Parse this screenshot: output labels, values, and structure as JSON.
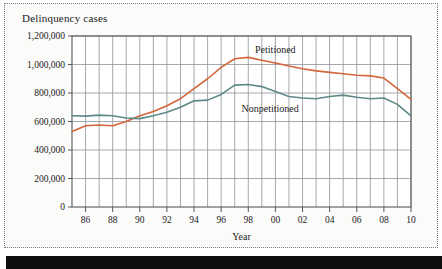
{
  "figure": {
    "title": "Delinquency cases",
    "colors": {
      "petitioned": "#d4663c",
      "nonpetitioned": "#5c8a86",
      "grid": "#8f9398",
      "axis": "#55585c",
      "text": "#1a1a1a",
      "background": "#fbfbfa",
      "frame": "#7a7a7a",
      "bottom_band": "#110f0d"
    }
  },
  "chart_data": {
    "type": "line",
    "title": "Delinquency cases",
    "xlabel": "Year",
    "ylabel": "Delinquency cases",
    "xlim": [
      1985,
      2010
    ],
    "ylim": [
      0,
      1200000
    ],
    "grid": true,
    "legend_position": "inline-annotation",
    "y_ticks": [
      0,
      200000,
      400000,
      600000,
      800000,
      1000000,
      1200000
    ],
    "y_tick_labels": [
      "0",
      "200,000",
      "400,000",
      "600,000",
      "800,000",
      "1,000,000",
      "1,200,000"
    ],
    "x_ticks": [
      1986,
      1988,
      1990,
      1992,
      1994,
      1996,
      1998,
      2000,
      2002,
      2004,
      2006,
      2008,
      2010
    ],
    "x_tick_labels": [
      "86",
      "88",
      "90",
      "92",
      "94",
      "96",
      "98",
      "00",
      "02",
      "04",
      "06",
      "08",
      "10"
    ],
    "x": [
      1985,
      1986,
      1987,
      1988,
      1989,
      1990,
      1991,
      1992,
      1993,
      1994,
      1995,
      1996,
      1997,
      1998,
      1999,
      2000,
      2001,
      2002,
      2003,
      2004,
      2005,
      2006,
      2007,
      2008,
      2009,
      2010
    ],
    "series": [
      {
        "name": "Petitioned",
        "color": "#d4663c",
        "values": [
          530000,
          570000,
          575000,
          570000,
          600000,
          640000,
          670000,
          710000,
          760000,
          830000,
          900000,
          980000,
          1040000,
          1050000,
          1030000,
          1010000,
          990000,
          970000,
          955000,
          945000,
          935000,
          925000,
          920000,
          905000,
          830000,
          755000
        ]
      },
      {
        "name": "Nonpetitioned",
        "color": "#5c8a86",
        "values": [
          640000,
          638000,
          645000,
          640000,
          625000,
          620000,
          640000,
          665000,
          700000,
          745000,
          750000,
          790000,
          855000,
          860000,
          845000,
          810000,
          775000,
          765000,
          760000,
          775000,
          785000,
          770000,
          760000,
          765000,
          720000,
          640000
        ]
      }
    ],
    "annotations": [
      {
        "text": "Petitioned",
        "series": "Petitioned",
        "x": 1998.5,
        "y": 1105000
      },
      {
        "text": "Nonpetitioned",
        "series": "Nonpetitioned",
        "x": 1997.5,
        "y": 690000
      }
    ]
  }
}
